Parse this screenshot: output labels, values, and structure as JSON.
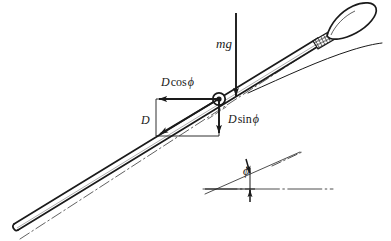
{
  "figure": {
    "background_color": "#ffffff",
    "ink_color": "#1a1a1a",
    "width": 391,
    "height": 241
  },
  "labels": {
    "weight": {
      "symbol": "mg",
      "italic": true
    },
    "drag_horizontal": {
      "var": "D",
      "func": "cos",
      "angle": "ϕ"
    },
    "drag_vertical": {
      "var": "D",
      "func": "sin",
      "angle": "ϕ"
    },
    "drag_resultant": {
      "symbol": "D"
    },
    "angle": {
      "symbol": "ϕ"
    }
  },
  "text": {
    "mg": "mg",
    "d_cos": "D cos ϕ",
    "d_sin": "D sin ϕ",
    "d": "D",
    "phi": "ϕ",
    "d_var": "D",
    "cos_word": "cos",
    "sin_word": "sin",
    "phi_glyph": "ϕ"
  },
  "elements": {
    "javelin": "javelin body drawn as a long slender shaft inclined up to the right, with a pointed spear head and a cross-hatched grip binding near the head",
    "center_of_mass": "small circle with filled dot marking the centre of mass on the javelin shaft",
    "trajectory": "thin curved solid line showing the flight path",
    "axis_lines": "dash-dot centre lines along the javelin axis and along the horizontal",
    "force_rectangle": "rectangle constructed from the centre of mass showing the drag components"
  },
  "vectors": [
    {
      "name": "weight",
      "label": "mg",
      "direction": "down",
      "from": [
        236,
        14
      ],
      "to": [
        236,
        99
      ]
    },
    {
      "name": "drag-horizontal-component",
      "label": "D cos ϕ",
      "direction": "left",
      "from": [
        219,
        99
      ],
      "to": [
        156,
        99
      ]
    },
    {
      "name": "drag-vertical-component",
      "label": "D sin ϕ",
      "direction": "down",
      "from": [
        219,
        99
      ],
      "to": [
        219,
        136
      ]
    },
    {
      "name": "drag-resultant",
      "label": "D",
      "direction": "down-left",
      "from": [
        219,
        99
      ],
      "to": [
        156,
        136
      ]
    }
  ],
  "angle_detail": {
    "symbol": "ϕ",
    "description": "angle between the javelin long axis and the horizontal, marked with two opposing arrows",
    "vertex": [
      216,
      189
    ],
    "inclined_ray_to": [
      298,
      155
    ],
    "horizontal_ray_to": [
      330,
      189
    ]
  }
}
